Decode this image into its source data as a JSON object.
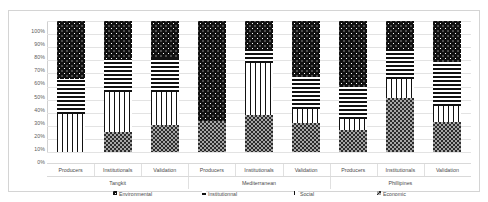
{
  "chart_data": {
    "type": "bar",
    "subtype": "100% stacked bar",
    "title": "",
    "xlabel": "",
    "ylabel": "",
    "ylim": [
      0,
      100
    ],
    "ytick_labels": [
      "100%",
      "90%",
      "80%",
      "70%",
      "60%",
      "50%",
      "40%",
      "30%",
      "20%",
      "10%",
      "0%"
    ],
    "ytick_values": [
      100,
      90,
      80,
      70,
      60,
      50,
      40,
      30,
      20,
      10,
      0
    ],
    "grid": true,
    "legend_position": "bottom",
    "groups": [
      "Tangkit",
      "Mediterranean",
      "Phillipines"
    ],
    "categories": [
      "Producers",
      "Institutionals",
      "Validation",
      "Producers",
      "Institutionals",
      "Validation",
      "Producers",
      "Institutionals",
      "Validation"
    ],
    "group_spans": [
      3,
      3,
      3
    ],
    "series": [
      {
        "name": "Economic",
        "pattern": "economic",
        "values": [
          0,
          15,
          21,
          24,
          28,
          22,
          17,
          41,
          23
        ]
      },
      {
        "name": "Social",
        "pattern": "social",
        "values": [
          29,
          31,
          25,
          0,
          40,
          11,
          8,
          15,
          12
        ]
      },
      {
        "name": "Institutionnal",
        "pattern": "institutionnal",
        "values": [
          27,
          25,
          26,
          0,
          10,
          24,
          25,
          23,
          34
        ]
      },
      {
        "name": "Environmental",
        "pattern": "environmental",
        "values": [
          44,
          29,
          28,
          76,
          22,
          43,
          50,
          21,
          31
        ]
      }
    ],
    "legend": [
      {
        "label": "Environmental",
        "marker": "environmental-swatch"
      },
      {
        "label": "Institutionnal",
        "marker": "institutionnal-swatch"
      },
      {
        "label": "Social",
        "marker": "social-swatch"
      },
      {
        "label": "Economic",
        "marker": "economic-swatch"
      }
    ],
    "colors": {
      "environmental": "#111111",
      "institutionnal": "#ffffff",
      "social": "#ffffff",
      "economic": "#a6a6a6",
      "gridline": "#e3e3e3",
      "text": "#4a4a4a",
      "border": "#d4d4d4"
    }
  }
}
